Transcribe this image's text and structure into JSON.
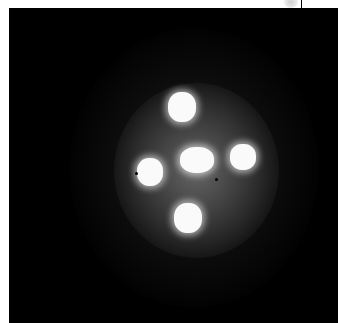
{
  "image": {
    "description": "Black astronomical image showing a quadruply lensed quasar (cross-shaped arrangement of four bright spots around a central bright core) surrounded by grainy diffuse glow",
    "colors": {
      "background": "#000000",
      "border": "#ffffff",
      "spots": "#fafafa"
    },
    "spots": [
      {
        "name": "top",
        "x": 182,
        "y": 106,
        "w": 28,
        "h": 30
      },
      {
        "name": "left",
        "x": 150,
        "y": 172,
        "w": 26,
        "h": 28
      },
      {
        "name": "center",
        "x": 197,
        "y": 160,
        "w": 34,
        "h": 26
      },
      {
        "name": "right",
        "x": 243,
        "y": 157,
        "w": 26,
        "h": 26
      },
      {
        "name": "bottom",
        "x": 188,
        "y": 218,
        "w": 28,
        "h": 30
      }
    ]
  }
}
